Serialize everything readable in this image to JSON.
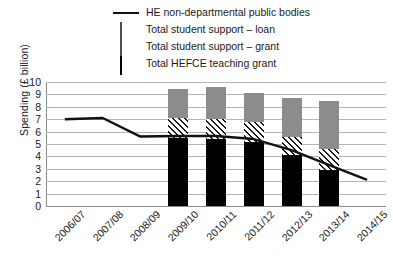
{
  "chart_data": {
    "type": "bar",
    "title": "",
    "xlabel": "",
    "ylabel": "Spending (£ billion)",
    "ylim": [
      0,
      10
    ],
    "ytick_step": 1,
    "grid": true,
    "legend_position": "top",
    "categories": [
      "2006/07",
      "2007/08",
      "2008/09",
      "2009/10",
      "2010/11",
      "2011/12",
      "2012/13",
      "2013/14",
      "2014/15"
    ],
    "yticks": [
      "0",
      "1",
      "2",
      "3",
      "4",
      "5",
      "6",
      "7",
      "8",
      "9",
      "10"
    ],
    "series": [
      {
        "name": "Total HEFCE teaching grant",
        "type": "bar-stack",
        "color": "#000000",
        "fill": "solid-black",
        "values": [
          null,
          null,
          null,
          5.5,
          5.4,
          5.15,
          4.1,
          2.9,
          null
        ]
      },
      {
        "name": "Total student support – grant",
        "type": "bar-stack",
        "color": "#1a1a1a",
        "fill": "diagonal-hatch",
        "values": [
          null,
          null,
          null,
          1.6,
          1.6,
          1.6,
          1.5,
          1.7,
          null
        ]
      },
      {
        "name": "Total student support – loan",
        "type": "bar-stack",
        "color": "#8c8c8c",
        "fill": "solid-grey",
        "values": [
          null,
          null,
          null,
          2.3,
          2.6,
          2.4,
          3.15,
          3.9,
          null
        ]
      },
      {
        "name": "HE non-departmental public bodies",
        "type": "line",
        "color": "#111111",
        "values": [
          7.0,
          7.1,
          5.6,
          5.65,
          5.65,
          5.4,
          4.5,
          3.3,
          2.1
        ]
      }
    ],
    "bar_totals": [
      null,
      null,
      null,
      9.4,
      9.6,
      9.15,
      8.75,
      8.5,
      null
    ],
    "legend": [
      {
        "label": "HE non-departmental public bodies",
        "key": "line",
        "color": "#111111"
      },
      {
        "label": "Total student support – loan",
        "key": "swatch-solid-grey",
        "color": "#8c8c8c"
      },
      {
        "label": "Total student support – grant",
        "key": "swatch-dotted-grey",
        "color": "#9a9a9a"
      },
      {
        "label": "Total HEFCE teaching grant",
        "key": "swatch-solid-black",
        "color": "#000000"
      }
    ]
  }
}
